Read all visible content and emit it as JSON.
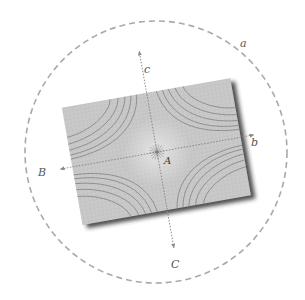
{
  "diagram": {
    "type": "physics-illustration",
    "labels": {
      "circle": "a",
      "axis_horizontal_pos": "b",
      "axis_horizontal_neg": "B",
      "axis_vertical_pos": "c",
      "axis_vertical_neg": "C",
      "center": "A"
    },
    "colors": {
      "background": "#ffffff",
      "circle_dash": "#a9a9a9",
      "paper": "#c8c8c8",
      "grid": "#b8b8b8",
      "field_lines": "#7a7a7a",
      "axes": "#8a8a8a",
      "label": "#555555",
      "shadow": "#333333"
    },
    "geometry": {
      "circle_center": [
        156,
        152
      ],
      "circle_radius": 131,
      "paper_center": [
        157,
        152
      ],
      "paper_size": [
        171,
        119
      ],
      "paper_rotation_deg": -10
    }
  }
}
